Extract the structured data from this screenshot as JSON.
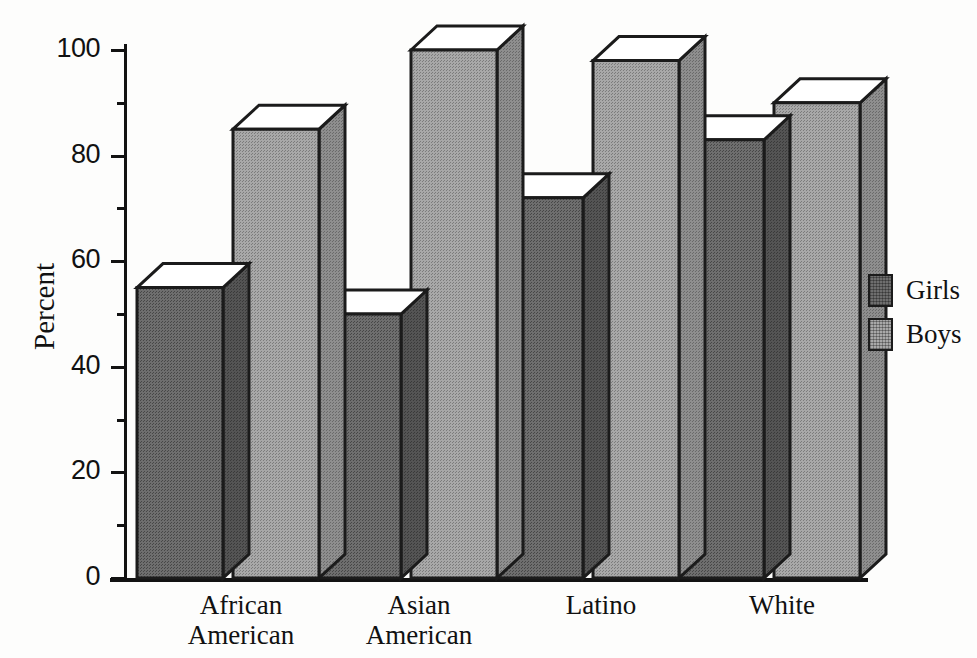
{
  "chart_data": {
    "type": "bar",
    "title": "",
    "subtitle": "",
    "xlabel": "",
    "ylabel": "Percent",
    "ylim": [
      0,
      100
    ],
    "ytick_labels": [
      "0",
      "20",
      "40",
      "60",
      "80",
      "100"
    ],
    "ytick_values": [
      0,
      20,
      40,
      60,
      80,
      100
    ],
    "yminor_values": [
      10,
      30,
      50,
      70,
      90
    ],
    "grid": false,
    "legend_position": "right",
    "style": "3d-grayscale-bars",
    "categories": [
      "African American",
      "Asian American",
      "Latino",
      "White"
    ],
    "category_lines": [
      [
        "African",
        "American"
      ],
      [
        "Asian",
        "American"
      ],
      [
        "Latino"
      ],
      [
        "White"
      ]
    ],
    "series": [
      {
        "name": "Girls",
        "color": "#6e6e6e",
        "values": [
          55,
          50,
          72,
          83
        ]
      },
      {
        "name": "Boys",
        "color": "#a8a8a8",
        "values": [
          85,
          100,
          98,
          90
        ]
      }
    ]
  },
  "legend": {
    "items": [
      {
        "label": "Girls",
        "color": "#6e6e6e"
      },
      {
        "label": "Boys",
        "color": "#a8a8a8"
      }
    ]
  },
  "axis": {
    "y_title": "Percent"
  },
  "colors": {
    "girls_front": "#6e6e6e",
    "girls_side": "#545454",
    "boys_front": "#a8a8a8",
    "boys_side": "#8e8e8e",
    "top_face": "#ffffff",
    "outline": "#1b1b1b",
    "axis": "#121212",
    "background": "#fdfdfc"
  }
}
